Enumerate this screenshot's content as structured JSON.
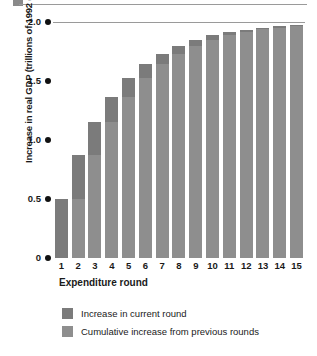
{
  "top_strip": {
    "swatch_color": "#8a8a8a",
    "rule_color": "#9a9a9a"
  },
  "axis": {
    "ylabel": "Increase in real GDP (trillions of 1992 dollars)",
    "xlabel": "Expenditure round",
    "yticks": [
      "0",
      "0.5",
      "1.0",
      "1.5",
      "2.0"
    ]
  },
  "legend": {
    "items": [
      {
        "label": "Increase in current round",
        "color": "#7b7b7b"
      },
      {
        "label": "Cumulative increase from previous rounds",
        "color": "#8e8e8e"
      }
    ]
  },
  "chart_data": {
    "type": "bar",
    "title": "",
    "xlabel": "Expenditure round",
    "ylabel": "Increase in real GDP (trillions of 1992 dollars)",
    "ylim": [
      0,
      2.0
    ],
    "yticks": [
      0,
      0.5,
      1.0,
      1.5,
      2.0
    ],
    "grid": false,
    "stacked": true,
    "legend_position": "bottom-left",
    "categories": [
      "1",
      "2",
      "3",
      "4",
      "5",
      "6",
      "7",
      "8",
      "9",
      "10",
      "11",
      "12",
      "13",
      "14",
      "15"
    ],
    "series": [
      {
        "name": "Cumulative increase from previous rounds",
        "color": "#8e8e8e",
        "values": [
          0,
          0.5,
          0.875,
          1.156,
          1.367,
          1.525,
          1.644,
          1.733,
          1.8,
          1.85,
          1.887,
          1.915,
          1.937,
          1.952,
          1.964
        ]
      },
      {
        "name": "Increase in current round",
        "color": "#7b7b7b",
        "values": [
          0.5,
          0.375,
          0.281,
          0.211,
          0.158,
          0.119,
          0.089,
          0.067,
          0.05,
          0.038,
          0.028,
          0.021,
          0.016,
          0.012,
          0.009
        ]
      }
    ],
    "totals": [
      0.5,
      0.875,
      1.156,
      1.367,
      1.525,
      1.644,
      1.733,
      1.8,
      1.85,
      1.887,
      1.915,
      1.937,
      1.952,
      1.964,
      1.973
    ]
  }
}
